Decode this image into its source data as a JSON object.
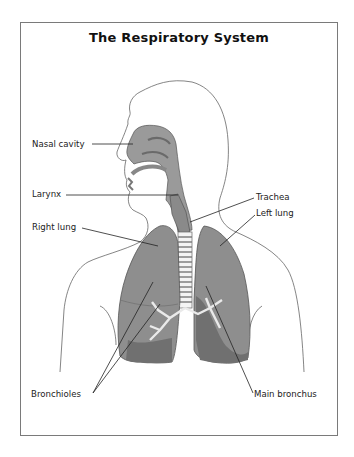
{
  "title": "The Respiratory System",
  "labels": {
    "nasal_cavity": "Nasal cavity",
    "larynx": "Larynx",
    "trachea": "Trachea",
    "left_lung": "Left lung",
    "right_lung": "Right lung",
    "bronchioles": "Bronchioles",
    "main_bronchus": "Main bronchus"
  },
  "colors": {
    "organ_fill": "#9a9a9a",
    "lung_fill": "#8e8e8e",
    "lung_dark": "#707070",
    "outline": "#555555"
  }
}
